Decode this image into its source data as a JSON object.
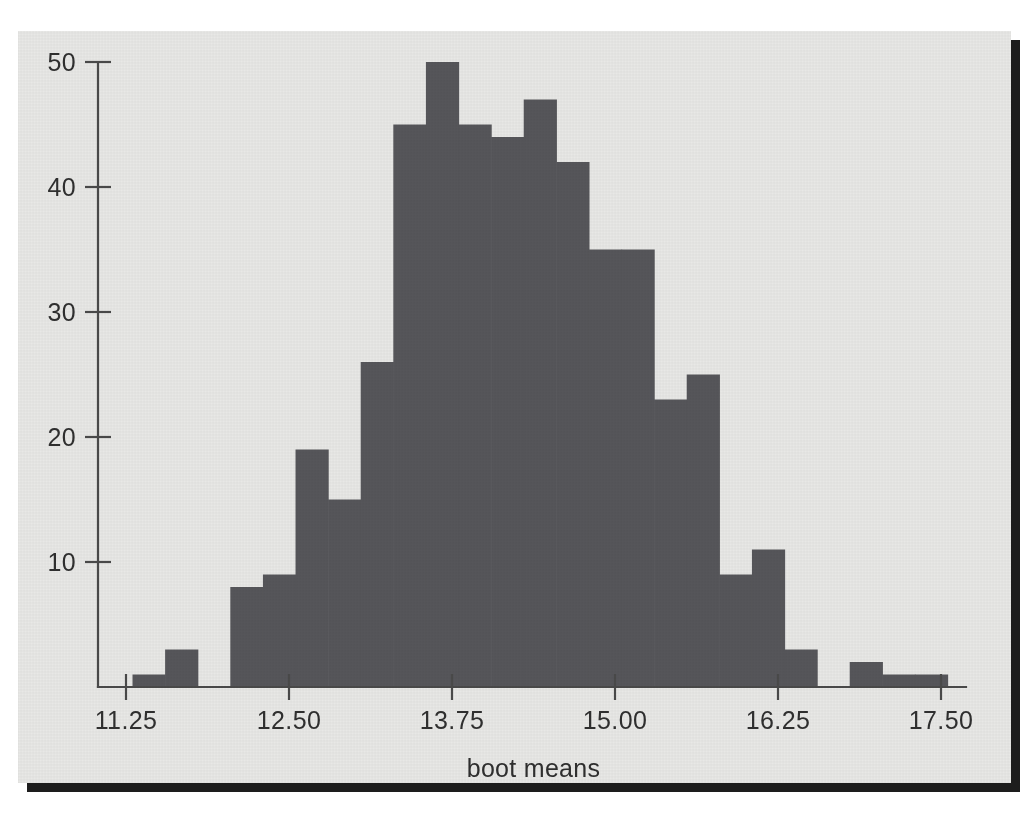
{
  "figure": {
    "background_color": "#e8e8e6",
    "ink_color": "#56565a",
    "axis_color": "#4a4a4a"
  },
  "chart_data": {
    "type": "bar",
    "subtype": "histogram",
    "title": "",
    "xlabel": "boot means",
    "ylabel": "",
    "xlim": [
      11.25,
      17.5
    ],
    "ylim": [
      0,
      50
    ],
    "bin_width": 0.25,
    "grid": false,
    "legend": null,
    "xticks": [
      "11.25",
      "12.50",
      "13.75",
      "15.00",
      "16.25",
      "17.50"
    ],
    "xtick_values": [
      11.25,
      12.5,
      13.75,
      15.0,
      16.25,
      17.5
    ],
    "yticks": [
      "10",
      "20",
      "30",
      "40",
      "50"
    ],
    "ytick_values": [
      10,
      20,
      30,
      40,
      50
    ],
    "bin_edges": [
      11.3,
      11.55,
      11.8,
      12.05,
      12.3,
      12.55,
      12.8,
      13.05,
      13.3,
      13.55,
      13.8,
      14.05,
      14.3,
      14.55,
      14.8,
      15.05,
      15.3,
      15.55,
      15.8,
      16.05,
      16.3,
      16.55,
      16.8,
      17.05,
      17.3,
      17.55
    ],
    "values": [
      1,
      3,
      0,
      8,
      9,
      19,
      15,
      26,
      45,
      50,
      45,
      44,
      47,
      42,
      35,
      35,
      23,
      25,
      9,
      11,
      3,
      0,
      2,
      1,
      1
    ],
    "bars": [
      {
        "x0": 11.3,
        "x1": 11.55,
        "count": 1
      },
      {
        "x0": 11.55,
        "x1": 11.8,
        "count": 3
      },
      {
        "x0": 11.8,
        "x1": 12.05,
        "count": 0
      },
      {
        "x0": 12.05,
        "x1": 12.3,
        "count": 8
      },
      {
        "x0": 12.3,
        "x1": 12.55,
        "count": 9
      },
      {
        "x0": 12.55,
        "x1": 12.8,
        "count": 19
      },
      {
        "x0": 12.8,
        "x1": 13.05,
        "count": 15
      },
      {
        "x0": 13.05,
        "x1": 13.3,
        "count": 26
      },
      {
        "x0": 13.3,
        "x1": 13.55,
        "count": 45
      },
      {
        "x0": 13.55,
        "x1": 13.8,
        "count": 50
      },
      {
        "x0": 13.8,
        "x1": 14.05,
        "count": 45
      },
      {
        "x0": 14.05,
        "x1": 14.3,
        "count": 44
      },
      {
        "x0": 14.3,
        "x1": 14.55,
        "count": 47
      },
      {
        "x0": 14.55,
        "x1": 14.8,
        "count": 42
      },
      {
        "x0": 14.8,
        "x1": 15.05,
        "count": 35
      },
      {
        "x0": 15.05,
        "x1": 15.3,
        "count": 35
      },
      {
        "x0": 15.3,
        "x1": 15.55,
        "count": 23
      },
      {
        "x0": 15.55,
        "x1": 15.8,
        "count": 25
      },
      {
        "x0": 15.8,
        "x1": 16.05,
        "count": 9
      },
      {
        "x0": 16.05,
        "x1": 16.3,
        "count": 11
      },
      {
        "x0": 16.3,
        "x1": 16.55,
        "count": 3
      },
      {
        "x0": 16.55,
        "x1": 16.8,
        "count": 0
      },
      {
        "x0": 16.8,
        "x1": 17.05,
        "count": 2
      },
      {
        "x0": 17.05,
        "x1": 17.3,
        "count": 1
      },
      {
        "x0": 17.3,
        "x1": 17.55,
        "count": 1
      }
    ]
  }
}
